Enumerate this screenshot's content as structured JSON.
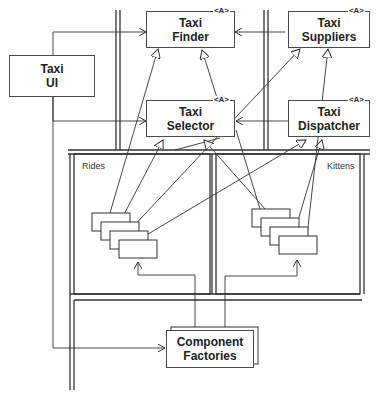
{
  "diagram": {
    "boxes": {
      "taxi_ui": {
        "label": "Taxi\nUI"
      },
      "taxi_finder": {
        "label": "Taxi\nFinder",
        "stereotype": "<A>"
      },
      "taxi_suppliers": {
        "label": "Taxi\nSuppliers",
        "stereotype": "<A>"
      },
      "taxi_selector": {
        "label": "Taxi\nSelector",
        "stereotype": "<A>"
      },
      "taxi_dispatcher": {
        "label": "Taxi\nDispatcher",
        "stereotype": "<A>"
      },
      "component_factories": {
        "label": "Component\nFactories"
      }
    },
    "regions": {
      "rides": {
        "label": "Rides"
      },
      "kittens": {
        "label": "Kittens"
      }
    },
    "colors": {
      "line": "#333333",
      "background": "#ffffff"
    }
  }
}
